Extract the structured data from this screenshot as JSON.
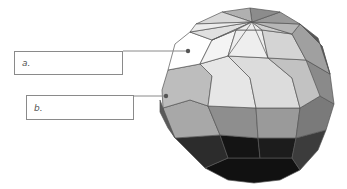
{
  "diagram": {
    "labels": [
      {
        "id": "a",
        "text": "a."
      },
      {
        "id": "b",
        "text": "b."
      }
    ],
    "colors": {
      "leader_line": "#8a8a8a",
      "facet_edge": "#555555",
      "facet_light": "#f2f2f2",
      "facet_mid": "#a8a8a8",
      "facet_dark": "#3a3a3a",
      "facet_darkest": "#1a1a1a"
    }
  }
}
